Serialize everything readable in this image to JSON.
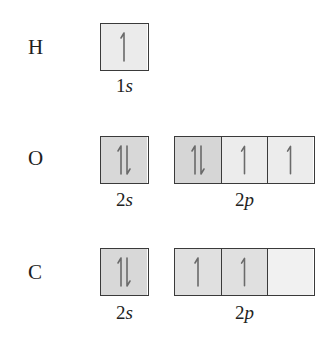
{
  "diagram": {
    "type": "orbital-box-diagram",
    "colors": {
      "border": "#3a3a3a",
      "arrow": "#6a6a6a",
      "paired_fill": "#d8d8d8",
      "single_fill": "#ebebeb",
      "empty_fill": "#f1f1f1"
    },
    "rows": [
      {
        "element": "H",
        "subshells": [
          {
            "label_num": "1",
            "label_letter": "s",
            "orbitals": [
              {
                "electrons": "up",
                "fill": "#ebebeb"
              }
            ]
          }
        ]
      },
      {
        "element": "O",
        "subshells": [
          {
            "label_num": "2",
            "label_letter": "s",
            "orbitals": [
              {
                "electrons": "paired",
                "fill": "#d8d8d8"
              }
            ]
          },
          {
            "label_num": "2",
            "label_letter": "p",
            "orbitals": [
              {
                "electrons": "paired",
                "fill": "#d6d6d6"
              },
              {
                "electrons": "up",
                "fill": "#ececec"
              },
              {
                "electrons": "up",
                "fill": "#ececec"
              }
            ]
          }
        ]
      },
      {
        "element": "C",
        "subshells": [
          {
            "label_num": "2",
            "label_letter": "s",
            "orbitals": [
              {
                "electrons": "paired",
                "fill": "#d8d8d8"
              }
            ]
          },
          {
            "label_num": "2",
            "label_letter": "p",
            "orbitals": [
              {
                "electrons": "up",
                "fill": "#e0e0e0"
              },
              {
                "electrons": "up",
                "fill": "#e0e0e0"
              },
              {
                "electrons": "empty",
                "fill": "#f1f1f1"
              }
            ]
          }
        ]
      }
    ]
  }
}
